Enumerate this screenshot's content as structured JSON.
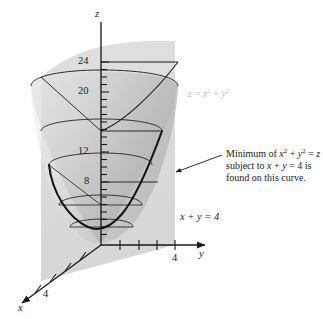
{
  "figure": {
    "kind": "3d-surface-plot",
    "background": "#ffffff",
    "ink": "#1a1a1a",
    "plane_fill": "#d8d8d8",
    "surface_fill": "#c9c9c9",
    "faint_text": "#b9b9b9"
  },
  "axes": {
    "z": {
      "name": "z",
      "ticks": [
        {
          "value": "24",
          "show_label": true
        },
        {
          "value": "20",
          "show_label": true
        },
        {
          "value": "12",
          "show_label": true
        },
        {
          "value": "8",
          "show_label": true
        }
      ]
    },
    "y": {
      "name": "y",
      "ticks": [
        {
          "value": "4",
          "show_label": true
        }
      ]
    },
    "x": {
      "name": "x",
      "ticks": [
        {
          "value": "4",
          "show_label": true
        }
      ]
    }
  },
  "labels": {
    "surface_equation_z": "z",
    "surface_equation_eq": " = ",
    "surface_equation_x": "x",
    "surface_equation_x_pow": "2",
    "surface_equation_plus": " + ",
    "surface_equation_y": "y",
    "surface_equation_y_pow": "2",
    "plane_equation": "x + y = 4"
  },
  "callout": {
    "line1_pre": "Minimum of ",
    "line1_x": "x",
    "line1_xpow": "2",
    "line1_plus": " + ",
    "line1_y": "y",
    "line1_ypow": "2",
    "line1_post": " = ",
    "line1_z": "z",
    "line2_pre": "subject to ",
    "line2_x": "x",
    "line2_mid": " + ",
    "line2_y": "y",
    "line2_post": " = 4 is",
    "line3": "found on this curve."
  }
}
